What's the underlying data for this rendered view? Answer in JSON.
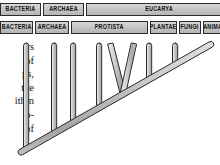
{
  "figure": {
    "type": "phylogenetic-tree"
  },
  "header": {
    "domain_row": {
      "name": "domains",
      "items": [
        {
          "label": "BACTERIA"
        },
        {
          "label": "ARCHAEA"
        },
        {
          "label": "EUCARYA"
        }
      ]
    },
    "kingdom_row": {
      "name": "kingdoms",
      "items": [
        {
          "label": "BACTERIA"
        },
        {
          "label": "ARCHAEA"
        },
        {
          "label": "PROTISTA"
        },
        {
          "label": "PLANTAE"
        },
        {
          "label": "FUNGI"
        },
        {
          "label": "ANIMALIA"
        }
      ]
    }
  },
  "body_text_fragments": [
    "rs",
    "of",
    "ps,",
    "the",
    "ithin",
    "o-",
    "of"
  ],
  "colors": {
    "box_fill_light": "#d6d6d6",
    "box_fill_dark": "#b4b4b4",
    "box_border": "#2b2b2b",
    "branch_fill_light": "#efefef",
    "branch_fill_mid": "#c9c9c9",
    "branch_fill_dark": "#9a9a9a",
    "branch_outline": "#2b2b2b",
    "page_background": "#ffffff",
    "text": "#131313"
  },
  "tree": {
    "description": "Diagonal trunk ascending left-to-right with vertical lineage branches rising to the kingdom bars; one V-shaped fork near the Protista/Plantae boundary.",
    "trunk": {
      "root_x": 22,
      "root_y": 152,
      "tip_x": 212,
      "tip_y": 45
    },
    "branches": [
      {
        "name": "branch-1",
        "base_x": 27,
        "base_y": 149,
        "tip_x": 27,
        "tip_y": 44
      },
      {
        "name": "branch-2",
        "base_x": 55,
        "base_y": 133,
        "tip_x": 55,
        "tip_y": 44
      },
      {
        "name": "branch-3",
        "base_x": 74,
        "base_y": 122,
        "tip_x": 74,
        "tip_y": 44
      },
      {
        "name": "branch-4",
        "base_x": 100,
        "base_y": 108,
        "tip_x": 100,
        "tip_y": 44
      },
      {
        "name": "branch-5-fork-left",
        "base_x": 122,
        "base_y": 95,
        "tip_x": 110,
        "tip_y": 44
      },
      {
        "name": "branch-5-fork-right",
        "base_x": 122,
        "base_y": 95,
        "tip_x": 134,
        "tip_y": 44
      },
      {
        "name": "branch-6",
        "base_x": 150,
        "base_y": 79,
        "tip_x": 150,
        "tip_y": 44
      },
      {
        "name": "branch-7",
        "base_x": 176,
        "base_y": 65,
        "tip_x": 176,
        "tip_y": 44
      }
    ]
  }
}
